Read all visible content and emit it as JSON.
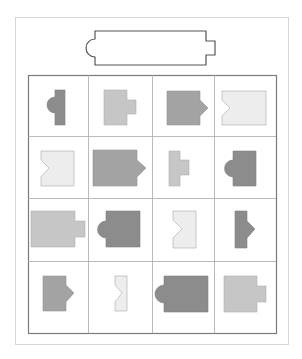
{
  "puzzle": {
    "description": "Visual shape-matching puzzle: a target outline shape above a 4x4 grid of gray shapes",
    "colors": {
      "background": "#ffffff",
      "frame": "#d6d6d6",
      "grid": "#7a7a7a",
      "grid_inner": "#a0a0a0",
      "target_stroke": "#555555",
      "dark": "#8c8c8c",
      "medium": "#a3a3a3",
      "light": "#c6c6c6",
      "very_light": "#ededed",
      "shape_stroke": "#9a9a9a"
    },
    "target": {
      "shape": "wide-rectangle",
      "left_feature": "semicircle-bump",
      "right_feature": "rectangular-notch"
    },
    "grid": {
      "rows": 4,
      "cols": 4,
      "cells": [
        {
          "row": 1,
          "col": 1,
          "shade": "dark",
          "body": "narrow",
          "feature": "left-semicircle"
        },
        {
          "row": 1,
          "col": 2,
          "shade": "light",
          "body": "medium",
          "feature": "right-tab"
        },
        {
          "row": 1,
          "col": 3,
          "shade": "medium",
          "body": "medium",
          "feature": "right-triangle"
        },
        {
          "row": 1,
          "col": 4,
          "shade": "very_light",
          "body": "wide",
          "feature": "left-v-notch"
        },
        {
          "row": 2,
          "col": 1,
          "shade": "very_light",
          "body": "medium",
          "feature": "left-v-notch"
        },
        {
          "row": 2,
          "col": 2,
          "shade": "medium",
          "body": "wide",
          "feature": "right-triangle"
        },
        {
          "row": 2,
          "col": 3,
          "shade": "light",
          "body": "narrow",
          "feature": "right-tab"
        },
        {
          "row": 2,
          "col": 4,
          "shade": "dark",
          "body": "medium",
          "feature": "left-semicircle"
        },
        {
          "row": 3,
          "col": 1,
          "shade": "light",
          "body": "wide",
          "feature": "right-tab"
        },
        {
          "row": 3,
          "col": 2,
          "shade": "dark",
          "body": "medium",
          "feature": "left-semicircle"
        },
        {
          "row": 3,
          "col": 3,
          "shade": "very_light",
          "body": "medium",
          "feature": "left-v-notch"
        },
        {
          "row": 3,
          "col": 4,
          "shade": "dark",
          "body": "narrow",
          "feature": "right-triangle"
        },
        {
          "row": 4,
          "col": 1,
          "shade": "medium",
          "body": "medium",
          "feature": "right-triangle"
        },
        {
          "row": 4,
          "col": 2,
          "shade": "very_light",
          "body": "narrow",
          "feature": "left-v-notch"
        },
        {
          "row": 4,
          "col": 3,
          "shade": "dark",
          "body": "wide",
          "feature": "left-semicircle"
        },
        {
          "row": 4,
          "col": 4,
          "shade": "light",
          "body": "medium",
          "feature": "right-tab"
        }
      ]
    }
  }
}
